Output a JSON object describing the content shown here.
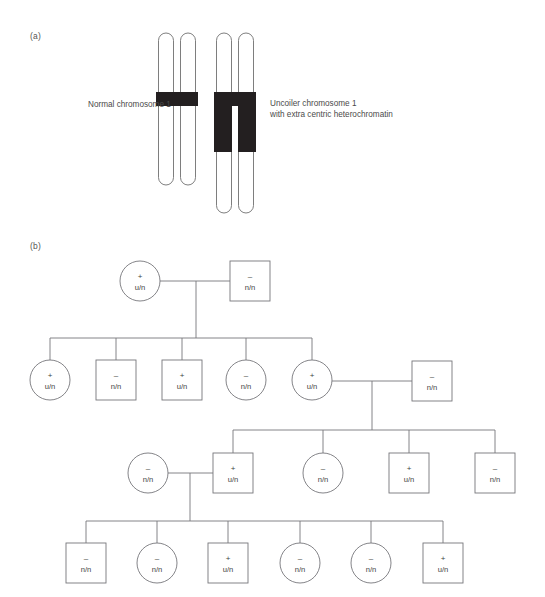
{
  "figure": {
    "panel_a_label": "(a)",
    "panel_b_label": "(b)"
  },
  "chromosome_panel": {
    "normal_caption": "Normal chromosome 1",
    "uncoiler_caption": "Uncoiler chromosome 1\nwith extra centric heterochromatin",
    "band_color": "#231f20",
    "outline_color": "#6f6f6f",
    "normal_chromosome": {
      "name": "normal-chromosome-1",
      "chromatids": 2,
      "band_label": "centromeric heterochromatin band"
    },
    "uncoiler_chromosome": {
      "name": "uncoiler-chromosome-1",
      "chromatids": 2,
      "band_label": "extra centric heterochromatin block"
    }
  },
  "pedigree": {
    "line_color": "#76767a",
    "legend": {
      "circle_meaning": "female",
      "square_meaning": "male",
      "plus_meaning": "uncoiler present",
      "minus_meaning": "uncoiler absent"
    },
    "generations": [
      {
        "id": "I",
        "individuals": [
          {
            "id": "I-1",
            "shape": "circle",
            "sign": "+",
            "genotype": "u/n"
          },
          {
            "id": "I-2",
            "shape": "square",
            "sign": "–",
            "genotype": "n/n"
          }
        ]
      },
      {
        "id": "II",
        "individuals": [
          {
            "id": "II-1",
            "shape": "circle",
            "sign": "+",
            "genotype": "u/n"
          },
          {
            "id": "II-2",
            "shape": "square",
            "sign": "–",
            "genotype": "n/n"
          },
          {
            "id": "II-3",
            "shape": "square",
            "sign": "+",
            "genotype": "u/n"
          },
          {
            "id": "II-4",
            "shape": "circle",
            "sign": "–",
            "genotype": "n/n"
          },
          {
            "id": "II-5",
            "shape": "circle",
            "sign": "+",
            "genotype": "u/n"
          },
          {
            "id": "II-6",
            "shape": "square",
            "sign": "–",
            "genotype": "n/n"
          }
        ]
      },
      {
        "id": "III",
        "individuals": [
          {
            "id": "III-1",
            "shape": "circle",
            "sign": "–",
            "genotype": "n/n"
          },
          {
            "id": "III-2",
            "shape": "square",
            "sign": "+",
            "genotype": "u/n"
          },
          {
            "id": "III-3",
            "shape": "circle",
            "sign": "–",
            "genotype": "n/n"
          },
          {
            "id": "III-4",
            "shape": "square",
            "sign": "+",
            "genotype": "u/n"
          },
          {
            "id": "III-5",
            "shape": "square",
            "sign": "–",
            "genotype": "n/n"
          }
        ]
      },
      {
        "id": "IV",
        "individuals": [
          {
            "id": "IV-1",
            "shape": "square",
            "sign": "–",
            "genotype": "n/n"
          },
          {
            "id": "IV-2",
            "shape": "circle",
            "sign": "–",
            "genotype": "n/n"
          },
          {
            "id": "IV-3",
            "shape": "square",
            "sign": "+",
            "genotype": "u/n"
          },
          {
            "id": "IV-4",
            "shape": "circle",
            "sign": "–",
            "genotype": "n/n"
          },
          {
            "id": "IV-5",
            "shape": "circle",
            "sign": "–",
            "genotype": "n/n"
          },
          {
            "id": "IV-6",
            "shape": "square",
            "sign": "+",
            "genotype": "u/n"
          }
        ]
      }
    ]
  }
}
